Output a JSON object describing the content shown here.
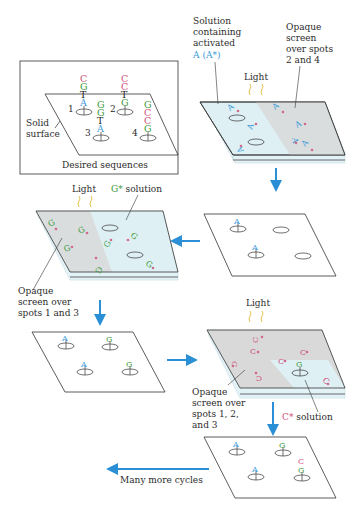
{
  "colors": {
    "A": "#3a9ad9",
    "G": "#3a9a3a",
    "C": "#d0507a",
    "T": "#222222",
    "arrow": "#2a8fd4",
    "light": "#e8c24a",
    "glass": "#d8eef4",
    "screen": "#d6d6d6",
    "star": "#d06a8a",
    "text": "#2b2b2b"
  },
  "desired_box": {
    "caption": "Desired sequences",
    "surface_label_1": "Solid",
    "surface_label_2": "surface",
    "spots": [
      {
        "number": "1",
        "sequence_bottom_to_top": [
          "A",
          "T",
          "G",
          "C"
        ]
      },
      {
        "number": "2",
        "sequence_bottom_to_top": [
          "G",
          "T",
          "C",
          "C"
        ]
      },
      {
        "number": "3",
        "sequence_bottom_to_top": [
          "A",
          "T",
          "G",
          "G"
        ]
      },
      {
        "number": "4",
        "sequence_bottom_to_top": [
          "G",
          "C",
          "C",
          "G"
        ]
      }
    ]
  },
  "step1": {
    "solution_label": [
      "Solution",
      "containing",
      "activated"
    ],
    "solution_nucleotide": "A",
    "solution_activated": "(A*)",
    "screen_label": [
      "Opaque",
      "screen",
      "over spots",
      "2 and 4"
    ],
    "light_label": "Light",
    "reagent": "A*"
  },
  "step2": {
    "light_label": "Light",
    "solution_label": "solution",
    "solution_nucleotide": "G*",
    "screen_label": [
      "Opaque",
      "screen over",
      "spots 1 and 3"
    ],
    "reagent": "G*"
  },
  "step3": {
    "light_label": "Light",
    "solution_label": "solution",
    "solution_nucleotide": "C*",
    "screen_label": [
      "Opaque",
      "screen over",
      "spots 1, 2,",
      "and 3"
    ],
    "reagent": "C*"
  },
  "result1": {
    "spots": [
      "A",
      "",
      "A",
      ""
    ]
  },
  "result2": {
    "spots": [
      "A",
      "G",
      "A",
      "G"
    ]
  },
  "result3": {
    "spots": [
      "A",
      "G",
      "A",
      "G C"
    ]
  },
  "final": {
    "label": "Many more cycles"
  }
}
